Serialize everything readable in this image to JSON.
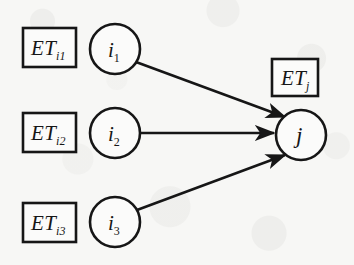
{
  "figure": {
    "background_color": "#f7f7f5",
    "stroke_color": "#161616",
    "fill_color": "#fbfbfa"
  },
  "source_boxes": [
    {
      "id": "et-i1",
      "base": "ET",
      "subscript": "i1",
      "x": 23,
      "y": 28,
      "w": 53,
      "h": 39
    },
    {
      "id": "et-i2",
      "base": "ET",
      "subscript": "i2",
      "x": 23,
      "y": 113,
      "w": 53,
      "h": 39
    },
    {
      "id": "et-i3",
      "base": "ET",
      "subscript": "i3",
      "x": 23,
      "y": 203,
      "w": 53,
      "h": 39
    }
  ],
  "target_box": {
    "id": "et-j",
    "base": "ET",
    "subscript": "j",
    "x": 272,
    "y": 59,
    "w": 46,
    "h": 37
  },
  "source_nodes": [
    {
      "id": "node-i1",
      "base": "i",
      "subscript": "1",
      "cx": 115,
      "cy": 49,
      "r": 25
    },
    {
      "id": "node-i2",
      "base": "i",
      "subscript": "2",
      "cx": 115,
      "cy": 133,
      "r": 25
    },
    {
      "id": "node-i3",
      "base": "i",
      "subscript": "3",
      "cx": 115,
      "cy": 222,
      "r": 25
    }
  ],
  "target_node": {
    "id": "node-j",
    "base": "j",
    "subscript": "",
    "cx": 301,
    "cy": 135,
    "r": 25
  },
  "edges": [
    {
      "id": "edge-i1-j",
      "from": "node-i1",
      "to": "node-j",
      "x1": 136,
      "y1": 62,
      "x2": 285,
      "y2": 117
    },
    {
      "id": "edge-i2-j",
      "from": "node-i2",
      "to": "node-j",
      "x1": 141,
      "y1": 133,
      "x2": 274,
      "y2": 133
    },
    {
      "id": "edge-i3-j",
      "from": "node-i3",
      "to": "node-j",
      "x1": 137,
      "y1": 210,
      "x2": 285,
      "y2": 155
    }
  ]
}
